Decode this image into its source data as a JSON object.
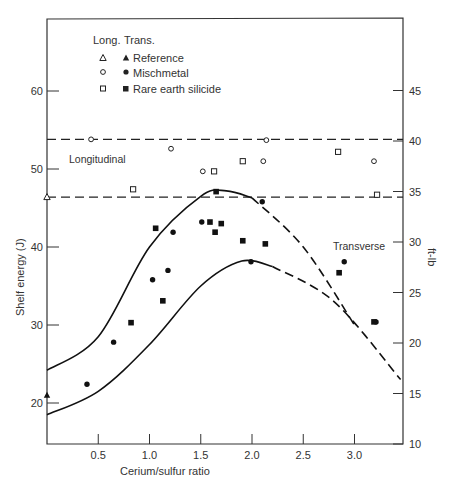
{
  "chart_data": {
    "type": "scatter",
    "title": "",
    "xlabel": "Cerium/sulfur ratio",
    "ylabel": "Shelf energy (J)",
    "ylabel_right": "ft-lb",
    "xlim": [
      0,
      3.45
    ],
    "ylim": [
      14,
      66
    ],
    "ylim_right": [
      10,
      48
    ],
    "x_ticks": [
      "0.5",
      "1.0",
      "1.5",
      "2.0",
      "2.5",
      "3.0"
    ],
    "x_tick_values": [
      0.5,
      1.0,
      1.5,
      2.0,
      2.5,
      3.0
    ],
    "y_ticks": [
      "20",
      "30",
      "40",
      "50",
      "60"
    ],
    "y_tick_values": [
      20,
      30,
      40,
      50,
      60
    ],
    "y_right_ticks": [
      "10",
      "15",
      "20",
      "25",
      "30",
      "35",
      "40",
      "45"
    ],
    "grid": false,
    "legend": {
      "position": "upper-left",
      "header_long": "Long.",
      "header_trans": "Trans.",
      "entries": [
        "Reference",
        "Mischmetal",
        "Rare earth silicide"
      ]
    },
    "annotations": [
      "Longitudinal",
      "Transverse"
    ],
    "series": [
      {
        "name": "Reference (Long.)",
        "marker": "open-triangle",
        "points": [
          [
            0.0,
            46.4
          ]
        ]
      },
      {
        "name": "Reference (Trans.)",
        "marker": "filled-triangle",
        "points": [
          [
            0.0,
            21.0
          ]
        ]
      },
      {
        "name": "Mischmetal (Long.)",
        "marker": "open-circle",
        "points": [
          [
            0.43,
            53.8
          ],
          [
            1.21,
            52.6
          ],
          [
            1.52,
            49.7
          ],
          [
            2.11,
            51.0
          ],
          [
            2.14,
            53.7
          ],
          [
            3.19,
            51.0
          ]
        ]
      },
      {
        "name": "Rare earth silicide (Long.)",
        "marker": "open-square",
        "points": [
          [
            0.84,
            47.4
          ],
          [
            1.63,
            49.7
          ],
          [
            1.91,
            51.0
          ],
          [
            2.84,
            52.2
          ],
          [
            3.22,
            46.7
          ]
        ]
      },
      {
        "name": "Mischmetal (Trans.)",
        "marker": "filled-circle",
        "points": [
          [
            0.39,
            22.4
          ],
          [
            0.65,
            27.8
          ],
          [
            1.03,
            35.8
          ],
          [
            1.18,
            37.0
          ],
          [
            1.23,
            41.9
          ],
          [
            1.51,
            43.2
          ],
          [
            1.99,
            38.1
          ],
          [
            2.1,
            45.8
          ],
          [
            2.9,
            38.1
          ],
          [
            3.21,
            30.4
          ]
        ]
      },
      {
        "name": "Rare earth silicide (Trans.)",
        "marker": "filled-square",
        "points": [
          [
            0.82,
            30.3
          ],
          [
            1.06,
            42.4
          ],
          [
            1.13,
            33.1
          ],
          [
            1.59,
            43.2
          ],
          [
            1.64,
            41.9
          ],
          [
            1.7,
            43.0
          ],
          [
            1.65,
            47.1
          ],
          [
            1.91,
            40.8
          ],
          [
            2.13,
            40.4
          ],
          [
            2.85,
            36.7
          ],
          [
            3.19,
            30.4
          ]
        ]
      }
    ],
    "reference_lines": [
      {
        "label": "Longitudinal upper",
        "y": 53.8,
        "style": "dashed"
      },
      {
        "label": "Longitudinal lower",
        "y": 46.4,
        "style": "dashed"
      }
    ],
    "band_curves": [
      {
        "name": "Transverse upper bound",
        "points": [
          [
            0.0,
            24.2
          ],
          [
            0.5,
            28.5
          ],
          [
            1.0,
            40.0
          ],
          [
            1.5,
            46.5
          ],
          [
            1.75,
            47.2
          ],
          [
            2.0,
            46.3
          ],
          [
            2.5,
            40.0
          ],
          [
            3.0,
            30.0
          ]
        ]
      },
      {
        "name": "Transverse lower bound",
        "points": [
          [
            0.0,
            18.5
          ],
          [
            0.5,
            21.5
          ],
          [
            1.0,
            27.5
          ],
          [
            1.5,
            35.0
          ],
          [
            1.9,
            38.2
          ],
          [
            2.2,
            37.5
          ],
          [
            2.8,
            33.0
          ],
          [
            3.45,
            23.0
          ]
        ]
      }
    ]
  }
}
